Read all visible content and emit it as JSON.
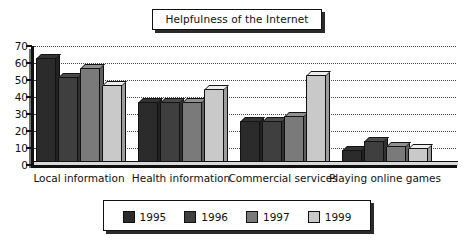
{
  "chart_data": {
    "type": "bar",
    "title": "Helpfulness of the Internet",
    "xlabel": "",
    "ylabel": "",
    "ylim": [
      0,
      70
    ],
    "yticks": [
      0,
      10,
      20,
      30,
      40,
      50,
      60,
      70
    ],
    "grid": true,
    "grid_style": "dotted-horizontal",
    "legend_position": "bottom",
    "categories": [
      "Local information",
      "Health information",
      "Commercial services",
      "Playing online games"
    ],
    "series": [
      {
        "name": "1995",
        "color": "#2b2b2b",
        "values": [
          63,
          37,
          26,
          9
        ]
      },
      {
        "name": "1996",
        "color": "#3f3f3f",
        "values": [
          52,
          37,
          26,
          14
        ]
      },
      {
        "name": "1997",
        "color": "#7a7a7a",
        "values": [
          57,
          37,
          29,
          11
        ]
      },
      {
        "name": "1999",
        "color": "#c9c9c9",
        "values": [
          47,
          45,
          53,
          10
        ]
      }
    ]
  },
  "colors": {
    "outline": "#111111",
    "grid": "#4a4a4a",
    "background": "#ffffff",
    "shadow": "#2b2b2b"
  }
}
